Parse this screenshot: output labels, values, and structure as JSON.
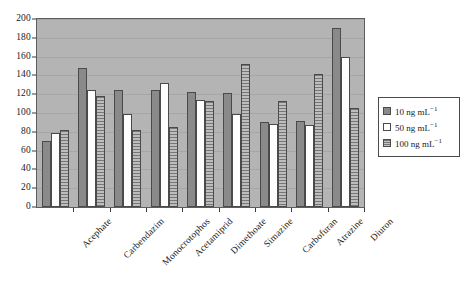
{
  "chart_data": {
    "type": "bar",
    "title": "",
    "xlabel": "",
    "ylabel": "",
    "ylim": [
      0,
      200
    ],
    "ytick_step": 20,
    "yticks": [
      0,
      20,
      40,
      60,
      80,
      100,
      120,
      140,
      160,
      180,
      200
    ],
    "grid": true,
    "legend_position": "right",
    "categories": [
      "Acephate",
      "Carbendazim",
      "Monocrotophos",
      "Acetamiprid",
      "Dimethoate",
      "Simazine",
      "Carbofuran",
      "Atrazine",
      "Diuron"
    ],
    "series": [
      {
        "name": "10 ng mL−1",
        "name_base": "10 ng mL",
        "name_exp": "−1",
        "color": "#8a8a8a",
        "fill": "solid-gray",
        "values": [
          70,
          148,
          125,
          125,
          122,
          121,
          90,
          92,
          190
        ]
      },
      {
        "name": "50 ng mL−1",
        "name_base": "50 ng mL",
        "name_exp": "−1",
        "color": "#ffffff",
        "fill": "white",
        "values": [
          79,
          125,
          99,
          132,
          114,
          99,
          88,
          87,
          160
        ]
      },
      {
        "name": "100 ng mL−1",
        "name_base": "100 ng mL",
        "name_exp": "−1",
        "color": "#9a9a9a",
        "fill": "horizontal-hatch",
        "values": [
          82,
          118,
          82,
          85,
          113,
          152,
          113,
          141,
          105
        ]
      }
    ]
  },
  "legend": {
    "items": [
      {
        "label_base": "10 ng mL",
        "label_exp": "−1"
      },
      {
        "label_base": "50 ng mL",
        "label_exp": "−1"
      },
      {
        "label_base": "100 ng mL",
        "label_exp": "−1"
      }
    ]
  }
}
